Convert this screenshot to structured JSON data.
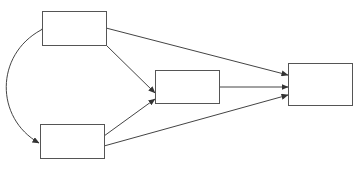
{
  "diagram": {
    "type": "path-diagram",
    "nodes": [
      {
        "id": "x1",
        "label": "",
        "x": 42,
        "y": 11,
        "w": 64,
        "h": 34
      },
      {
        "id": "x2",
        "label": "",
        "x": 40,
        "y": 124,
        "w": 64,
        "h": 34
      },
      {
        "id": "m",
        "label": "",
        "x": 155,
        "y": 70,
        "w": 64,
        "h": 33
      },
      {
        "id": "y",
        "label": "",
        "x": 288,
        "y": 63,
        "w": 64,
        "h": 42
      }
    ],
    "edges": [
      {
        "from": "x1",
        "to": "m",
        "kind": "directed"
      },
      {
        "from": "x1",
        "to": "y",
        "kind": "directed"
      },
      {
        "from": "x2",
        "to": "m",
        "kind": "directed"
      },
      {
        "from": "x2",
        "to": "y",
        "kind": "directed"
      },
      {
        "from": "m",
        "to": "y",
        "kind": "directed"
      },
      {
        "from": "x1",
        "to": "x2",
        "kind": "covariance-bidirectional"
      }
    ],
    "colors": {
      "stroke": "#444444",
      "box_border": "#555555",
      "background": "#ffffff"
    }
  }
}
